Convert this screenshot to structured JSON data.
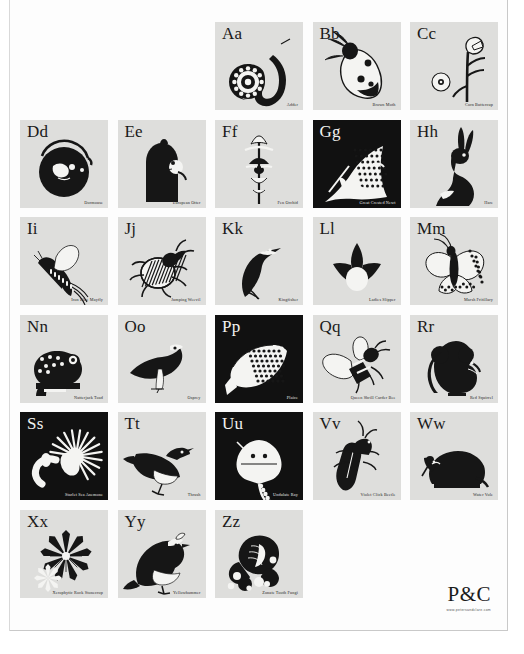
{
  "poster": {
    "title": "An Alphabet of British Wildlife",
    "columns": 5,
    "rows": 6,
    "background_color": "#ffffff",
    "tile_light_color": "#dededc",
    "tile_dark_color": "#111111",
    "ink_color": "#1a1a1a"
  },
  "logo": {
    "mark": "P&C",
    "url": "www.petersandclare.com"
  },
  "tiles": [
    {
      "slot": 0,
      "empty": true
    },
    {
      "slot": 1,
      "empty": true
    },
    {
      "slot": 2,
      "letter": "Aa",
      "caption": "Adder",
      "theme": "light",
      "art": "adder"
    },
    {
      "slot": 3,
      "letter": "Bb",
      "caption": "Brown Moth",
      "theme": "light",
      "art": "moth"
    },
    {
      "slot": 4,
      "letter": "Cc",
      "caption": "Corn Buttercup",
      "theme": "light",
      "art": "buttercup"
    },
    {
      "slot": 5,
      "letter": "Dd",
      "caption": "Dormouse",
      "theme": "light",
      "art": "dormouse"
    },
    {
      "slot": 6,
      "letter": "Ee",
      "caption": "European Otter",
      "theme": "light",
      "art": "otter"
    },
    {
      "slot": 7,
      "letter": "Ff",
      "caption": "Fen Orchid",
      "theme": "light",
      "art": "orchid"
    },
    {
      "slot": 8,
      "letter": "Gg",
      "caption": "Great Crested Newt",
      "theme": "dark",
      "art": "newt"
    },
    {
      "slot": 9,
      "letter": "Hh",
      "caption": "Hare",
      "theme": "light",
      "art": "hare"
    },
    {
      "slot": 10,
      "letter": "Ii",
      "caption": "Iron Blue Mayfly",
      "theme": "light",
      "art": "mayfly"
    },
    {
      "slot": 11,
      "letter": "Jj",
      "caption": "Jumping Weevil",
      "theme": "light",
      "art": "weevil"
    },
    {
      "slot": 12,
      "letter": "Kk",
      "caption": "Kingfisher",
      "theme": "light",
      "art": "kingfisher"
    },
    {
      "slot": 13,
      "letter": "Ll",
      "caption": "Ladies Slipper",
      "theme": "light",
      "art": "slipper"
    },
    {
      "slot": 14,
      "letter": "Mm",
      "caption": "Marsh Fritillary",
      "theme": "light",
      "art": "fritillary"
    },
    {
      "slot": 15,
      "letter": "Nn",
      "caption": "Natterjack Toad",
      "theme": "light",
      "art": "toad"
    },
    {
      "slot": 16,
      "letter": "Oo",
      "caption": "Osprey",
      "theme": "light",
      "art": "osprey"
    },
    {
      "slot": 17,
      "letter": "Pp",
      "caption": "Plaice",
      "theme": "dark",
      "art": "plaice"
    },
    {
      "slot": 18,
      "letter": "Qq",
      "caption": "Queen Shrill Carder Bee",
      "theme": "light",
      "art": "bee"
    },
    {
      "slot": 19,
      "letter": "Rr",
      "caption": "Red Squirrel",
      "theme": "light",
      "art": "squirrel"
    },
    {
      "slot": 20,
      "letter": "Ss",
      "caption": "Starlet Sea Anemone",
      "theme": "dark",
      "art": "anemone"
    },
    {
      "slot": 21,
      "letter": "Tt",
      "caption": "Thrush",
      "theme": "light",
      "art": "thrush"
    },
    {
      "slot": 22,
      "letter": "Uu",
      "caption": "Undulate Ray",
      "theme": "dark",
      "art": "ray"
    },
    {
      "slot": 23,
      "letter": "Vv",
      "caption": "Violet Click Beetle",
      "theme": "light",
      "art": "beetle"
    },
    {
      "slot": 24,
      "letter": "Ww",
      "caption": "Water Vole",
      "theme": "light",
      "art": "vole"
    },
    {
      "slot": 25,
      "letter": "Xx",
      "caption": "Xerophytic Rock Stonecrop",
      "theme": "light",
      "art": "stonecrop"
    },
    {
      "slot": 26,
      "letter": "Yy",
      "caption": "Yellowhammer",
      "theme": "light",
      "art": "yellowhammer"
    },
    {
      "slot": 27,
      "letter": "Zz",
      "caption": "Zonate Tooth Fungi",
      "theme": "light",
      "art": "fungi"
    },
    {
      "slot": 28,
      "empty": true
    },
    {
      "slot": 29,
      "empty": true
    }
  ]
}
